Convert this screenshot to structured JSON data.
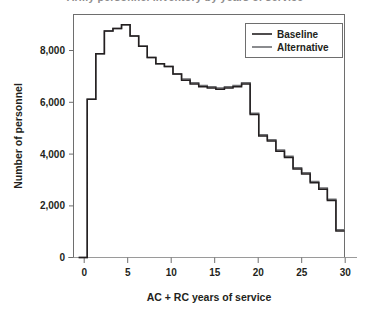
{
  "chart_data": {
    "type": "line",
    "subtype": "step",
    "title": "Army personnel inventory by years of service",
    "xlabel": "AC + RC years of service",
    "ylabel": "Number of personnel",
    "xlim": [
      -0.6,
      31.0
    ],
    "ylim": [
      0,
      9600
    ],
    "xticks": [
      0,
      5,
      10,
      15,
      20,
      25,
      30
    ],
    "xtick_labels": [
      "0",
      "5",
      "10",
      "15",
      "20",
      "25",
      "30"
    ],
    "yticks": [
      0,
      2000,
      4000,
      6000,
      8000
    ],
    "ytick_labels": [
      "0",
      "2,000",
      "4,000",
      "6,000",
      "8,000"
    ],
    "grid": false,
    "legend_position": "top-right",
    "x": [
      0,
      1,
      2,
      3,
      4,
      5,
      6,
      7,
      8,
      9,
      10,
      11,
      12,
      13,
      14,
      15,
      16,
      17,
      18,
      19,
      20,
      21,
      22,
      23,
      24,
      25,
      26,
      27,
      28,
      29,
      30
    ],
    "series": [
      {
        "name": "Baseline",
        "color": "#231f20",
        "values": [
          0,
          6250,
          8050,
          8950,
          9050,
          9200,
          8750,
          8350,
          7900,
          7650,
          7550,
          7250,
          7000,
          6850,
          6750,
          6700,
          6650,
          6700,
          6750,
          6850,
          5650,
          4800,
          4600,
          4200,
          3950,
          3500,
          3300,
          2950,
          2700,
          2250,
          1050
        ]
      },
      {
        "name": "Alternative",
        "color": "#6d6e71",
        "values": [
          0,
          6250,
          8050,
          8950,
          9050,
          9200,
          8750,
          8350,
          7900,
          7650,
          7550,
          7250,
          7050,
          6900,
          6800,
          6750,
          6700,
          6750,
          6800,
          6900,
          5700,
          4850,
          4650,
          4250,
          4000,
          3550,
          3350,
          3000,
          2750,
          2300,
          1100
        ]
      }
    ]
  },
  "legend": {
    "entries": [
      {
        "label": "Baseline",
        "swatch": "line-swatch-black"
      },
      {
        "label": "Alternative",
        "swatch": "line-swatch-gray"
      }
    ]
  },
  "axes": {
    "x_title": "AC + RC years of service",
    "y_title": "Number of personnel",
    "x_tick_labels": [
      "0",
      "5",
      "10",
      "15",
      "20",
      "25",
      "30"
    ],
    "y_tick_labels": [
      "0",
      "2,000",
      "4,000",
      "6,000",
      "8,000"
    ]
  }
}
